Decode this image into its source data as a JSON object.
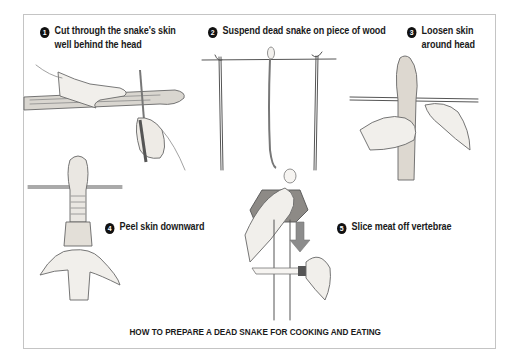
{
  "title": "HOW TO PREPARE A DEAD SNAKE FOR COOKING AND EATING",
  "steps": [
    {
      "number": "1",
      "line1": "Cut through the snake's skin",
      "line2": "well behind the head"
    },
    {
      "number": "2",
      "line1": "Suspend dead snake on piece of wood",
      "line2": ""
    },
    {
      "number": "3",
      "line1": "Loosen skin",
      "line2": "around head"
    },
    {
      "number": "4",
      "line1": "Peel skin downward",
      "line2": ""
    },
    {
      "number": "5",
      "line1": "Slice meat off vertebrae",
      "line2": ""
    }
  ],
  "colors": {
    "frame": "#c4c4c4",
    "ink": "#1a1a1a",
    "arrow": "#8c8c8c",
    "background": "#ffffff"
  }
}
